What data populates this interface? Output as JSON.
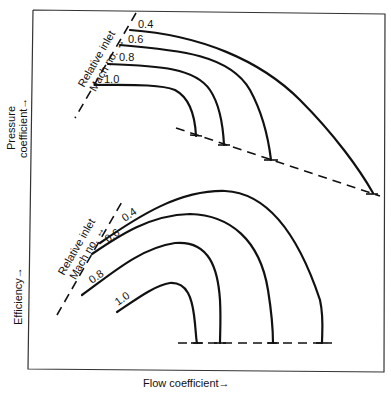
{
  "diagram": {
    "type": "compressor performance map (schematic)",
    "x_axis_label": "Flow coefficient→",
    "top_panel": {
      "y_axis_label_line1": "Pressure",
      "y_axis_label_line2": "coefficient→",
      "annotation_line1": "Relative inlet",
      "annotation_line2": "Mach no. ↔",
      "curves": [
        {
          "mach": "0.4"
        },
        {
          "mach": "0.6"
        },
        {
          "mach": "0.8"
        },
        {
          "mach": "1.0"
        }
      ]
    },
    "bottom_panel": {
      "y_axis_label": "Efficiency→",
      "annotation_line1": "Relative inlet",
      "annotation_line2": "Mach no. ↔",
      "curves": [
        {
          "mach": "0.4"
        },
        {
          "mach": "0.6"
        },
        {
          "mach": "0.8"
        },
        {
          "mach": "1.0"
        }
      ]
    }
  }
}
